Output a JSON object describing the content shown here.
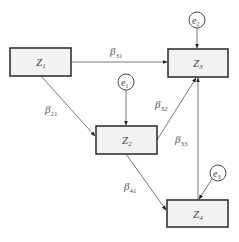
{
  "diagram": {
    "nodes": [
      {
        "id": "Z1",
        "base": "Z",
        "sub": "1"
      },
      {
        "id": "Z2",
        "base": "Z",
        "sub": "2"
      },
      {
        "id": "Z3",
        "base": "Z",
        "sub": "3"
      },
      {
        "id": "Z4",
        "base": "Z",
        "sub": "4"
      }
    ],
    "errors": [
      {
        "id": "e1",
        "base": "e",
        "sub": "1",
        "target": "Z2"
      },
      {
        "id": "e2",
        "base": "e",
        "sub": "2",
        "target": "Z3"
      },
      {
        "id": "e3",
        "base": "e",
        "sub": "3",
        "target": "Z4"
      }
    ],
    "edges": [
      {
        "id": "b31",
        "from": "Z1",
        "to": "Z3",
        "base": "β",
        "sub": "31"
      },
      {
        "id": "b21",
        "from": "Z1",
        "to": "Z2",
        "base": "β",
        "sub": "21"
      },
      {
        "id": "b32",
        "from": "Z2",
        "to": "Z3",
        "base": "β",
        "sub": "32"
      },
      {
        "id": "b33",
        "from": "Z4",
        "to": "Z3",
        "base": "β",
        "sub": "33"
      },
      {
        "id": "b41",
        "from": "Z2",
        "to": "Z4",
        "base": "β",
        "sub": "41"
      }
    ]
  }
}
